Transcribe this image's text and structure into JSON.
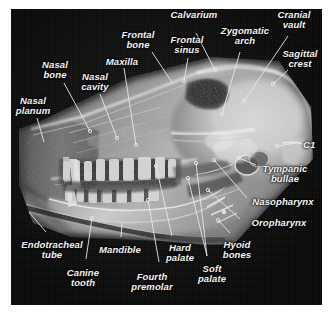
{
  "figure": {
    "kind": "lateral-skull-radiograph",
    "background_color": "#0a0a0a",
    "label_color": "#f2f2f2",
    "leader_color": "#e8e8e8"
  },
  "labels": [
    {
      "id": "calvarium",
      "text": "Calvarium",
      "x": 194,
      "y": 10,
      "align": "center"
    },
    {
      "id": "cranial-vault",
      "text": "Cranial\nvault",
      "x": 294,
      "y": 10,
      "align": "center"
    },
    {
      "id": "zygomatic-arch",
      "text": "Zygomatic\narch",
      "x": 245,
      "y": 26,
      "align": "center"
    },
    {
      "id": "frontal-bone",
      "text": "Frontal\nbone",
      "x": 138,
      "y": 30,
      "align": "center"
    },
    {
      "id": "frontal-sinus",
      "text": "Frontal\nsinus",
      "x": 187,
      "y": 35,
      "align": "center"
    },
    {
      "id": "sagittal-crest",
      "text": "Sagittal\ncrest",
      "x": 300,
      "y": 49,
      "align": "center"
    },
    {
      "id": "maxilla",
      "text": "Maxilla",
      "x": 122,
      "y": 57,
      "align": "center"
    },
    {
      "id": "nasal-bone",
      "text": "Nasal\nbone",
      "x": 55,
      "y": 60,
      "align": "center"
    },
    {
      "id": "nasal-cavity",
      "text": "Nasal\ncavity",
      "x": 95,
      "y": 72,
      "align": "center"
    },
    {
      "id": "nasal-planum",
      "text": "Nasal\nplanum",
      "x": 33,
      "y": 96,
      "align": "center"
    },
    {
      "id": "c1",
      "text": "C1",
      "x": 303,
      "y": 140,
      "align": "left"
    },
    {
      "id": "tympanic-bullae",
      "text": "Tympanic\nbullae",
      "x": 285,
      "y": 164,
      "align": "center"
    },
    {
      "id": "nasopharynx",
      "text": "Nasopharynx",
      "x": 283,
      "y": 197,
      "align": "center"
    },
    {
      "id": "oropharynx",
      "text": "Oropharynx",
      "x": 279,
      "y": 218,
      "align": "center"
    },
    {
      "id": "endotracheal-tube",
      "text": "Endotracheal\ntube",
      "x": 52,
      "y": 240,
      "align": "center"
    },
    {
      "id": "mandible",
      "text": "Mandible",
      "x": 120,
      "y": 245,
      "align": "center"
    },
    {
      "id": "hard-palate",
      "text": "Hard\npalate",
      "x": 180,
      "y": 243,
      "align": "center"
    },
    {
      "id": "hyoid-bones",
      "text": "Hyoid\nbones",
      "x": 237,
      "y": 240,
      "align": "center"
    },
    {
      "id": "canine-tooth",
      "text": "Canine\ntooth",
      "x": 83,
      "y": 268,
      "align": "center"
    },
    {
      "id": "fourth-premolar",
      "text": "Fourth\npremolar",
      "x": 152,
      "y": 272,
      "align": "center"
    },
    {
      "id": "soft-palate",
      "text": "Soft\npalate",
      "x": 212,
      "y": 264,
      "align": "center"
    }
  ],
  "leaders": [
    {
      "id": "leader-calvarium",
      "x1": 196,
      "y1": 33,
      "x2": 215,
      "y2": 70,
      "dot": "end"
    },
    {
      "id": "leader-cranial-vault",
      "x1": 288,
      "y1": 36,
      "x2": 244,
      "y2": 101,
      "dot": "end"
    },
    {
      "id": "leader-zygomatic-arch",
      "x1": 240,
      "y1": 52,
      "x2": 222,
      "y2": 114,
      "dot": "end"
    },
    {
      "id": "leader-frontal-bone",
      "x1": 152,
      "y1": 52,
      "x2": 173,
      "y2": 84,
      "dot": "none"
    },
    {
      "id": "leader-frontal-sinus",
      "x1": 188,
      "y1": 58,
      "x2": 184,
      "y2": 81,
      "dot": "end"
    },
    {
      "id": "leader-sagittal-crest",
      "x1": 288,
      "y1": 70,
      "x2": 273,
      "y2": 84,
      "dot": "end"
    },
    {
      "id": "leader-maxilla",
      "x1": 124,
      "y1": 68,
      "x2": 136,
      "y2": 145,
      "dot": "end"
    },
    {
      "id": "leader-nasal-bone",
      "x1": 64,
      "y1": 83,
      "x2": 90,
      "y2": 131,
      "dot": "end"
    },
    {
      "id": "leader-nasal-cavity",
      "x1": 100,
      "y1": 94,
      "x2": 117,
      "y2": 138,
      "dot": "end"
    },
    {
      "id": "leader-nasal-planum",
      "x1": 37,
      "y1": 118,
      "x2": 44,
      "y2": 142,
      "dot": "none"
    },
    {
      "id": "leader-c1",
      "x1": 296,
      "y1": 143,
      "x2": 277,
      "y2": 146,
      "dot": "end"
    },
    {
      "id": "leader-tympanic-bullae",
      "x1": 256,
      "y1": 165,
      "x2": 239,
      "y2": 158,
      "dot": "end"
    },
    {
      "id": "leader-nasopharynx",
      "x1": 247,
      "y1": 198,
      "x2": 214,
      "y2": 160,
      "dot": "end"
    },
    {
      "id": "leader-oropharynx",
      "x1": 240,
      "y1": 219,
      "x2": 208,
      "y2": 190,
      "dot": "end"
    },
    {
      "id": "leader-endotracheal",
      "x1": 46,
      "y1": 232,
      "x2": 29,
      "y2": 212,
      "dot": "none"
    },
    {
      "id": "leader-mandible",
      "x1": 121,
      "y1": 237,
      "x2": 122,
      "y2": 223,
      "dot": "none"
    },
    {
      "id": "leader-hard-palate",
      "x1": 172,
      "y1": 236,
      "x2": 156,
      "y2": 166,
      "dot": "end"
    },
    {
      "id": "leader-hyoid-bones",
      "x1": 230,
      "y1": 233,
      "x2": 218,
      "y2": 220,
      "dot": "end"
    },
    {
      "id": "leader-canine-tooth",
      "x1": 86,
      "y1": 259,
      "x2": 92,
      "y2": 218,
      "dot": "end"
    },
    {
      "id": "leader-fourth-premolar",
      "x1": 159,
      "y1": 262,
      "x2": 148,
      "y2": 200,
      "dot": "end"
    },
    {
      "id": "leader-soft-palate",
      "x1": 207,
      "y1": 256,
      "x2": 188,
      "y2": 178,
      "dot": "end"
    },
    {
      "id": "leader-soft-palate-b",
      "x1": 207,
      "y1": 256,
      "x2": 196,
      "y2": 163,
      "dot": "end"
    }
  ]
}
